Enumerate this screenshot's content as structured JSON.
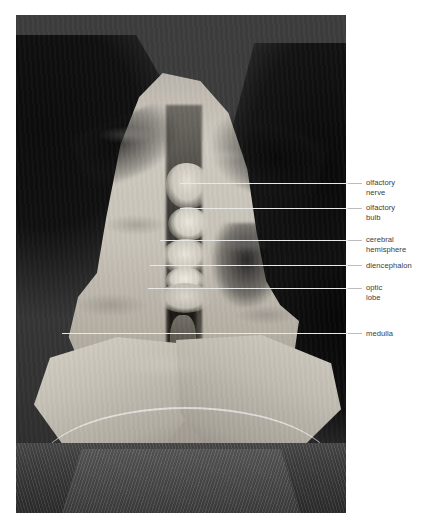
{
  "figure": {
    "kind": "labelled-anatomy-photograph",
    "background_color": "#ffffff",
    "photo": {
      "border_color": "#ffffff",
      "dominant_colors": [
        "#3a3a3a",
        "#c6c1b7",
        "#0d0d0d",
        "#e9e9e9"
      ]
    },
    "labels": [
      {
        "id": "olfactory-nerve",
        "text": "olfactory\nnerve",
        "line1": "olfactory",
        "line2": "nerve",
        "leader_y": 183,
        "leader_x_start": 180,
        "leader_x_end": 362,
        "text_top": 178
      },
      {
        "id": "olfactory-bulb",
        "text": "olfactory\nbulb",
        "line1": "olfactory",
        "line2": "bulb",
        "leader_y": 208,
        "leader_x_start": 180,
        "leader_x_end": 362,
        "text_top": 203
      },
      {
        "id": "cerebral-hemisphere",
        "text": "cerebral\nhemisphere",
        "line1": "cerebral",
        "line2": "hemisphere",
        "leader_y": 240,
        "leader_x_start": 160,
        "leader_x_end": 362,
        "text_top": 235
      },
      {
        "id": "diencephalon",
        "text": "diencephalon",
        "line1": "diencephalon",
        "line2": "",
        "leader_y": 265,
        "leader_x_start": 150,
        "leader_x_end": 362,
        "text_top": 261
      },
      {
        "id": "optic-lobe",
        "text": "optic\nlobe",
        "line1": "optic",
        "line2": "lobe",
        "leader_y": 288,
        "leader_x_start": 148,
        "leader_x_end": 362,
        "text_top": 283
      },
      {
        "id": "medulla",
        "text": "medulla",
        "line1": "medulla",
        "line2": "",
        "leader_y": 333,
        "leader_x_start": 62,
        "leader_x_end": 362,
        "text_top": 329
      }
    ]
  }
}
